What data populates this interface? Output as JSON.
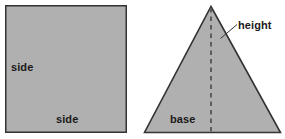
{
  "figure": {
    "background_color": "#ffffff",
    "shape_fill_color": "#b0b0b0",
    "shape_stroke_color": "#333333",
    "dash_color": "#555555",
    "leader_color": "#333333",
    "shapes": {
      "square": {
        "name": "square",
        "labels": {
          "side_left": "side",
          "side_bottom": "side"
        }
      },
      "triangle": {
        "name": "triangle",
        "labels": {
          "base": "base",
          "height": "height"
        }
      }
    }
  }
}
